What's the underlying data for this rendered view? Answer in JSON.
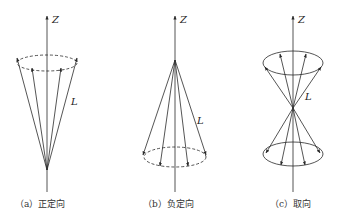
{
  "colors": {
    "stroke": "#2a2a2a",
    "background": "#ffffff"
  },
  "panels": [
    {
      "id": "a",
      "axis_label": "Z",
      "vector_label": "L",
      "caption": "（a）正定向",
      "description": "Vectors L precess on a cone pointing upward toward +Z; dashed circle at top"
    },
    {
      "id": "b",
      "axis_label": "Z",
      "vector_label": "L",
      "caption": "（b）负定向",
      "description": "Vectors L precess on a cone pointing downward toward -Z; dashed circle at bottom"
    },
    {
      "id": "c",
      "axis_label": "Z",
      "vector_label": "L",
      "caption": "（c）取向",
      "description": "Double cone: vectors L on both upper and lower cones with solid circles"
    }
  ]
}
